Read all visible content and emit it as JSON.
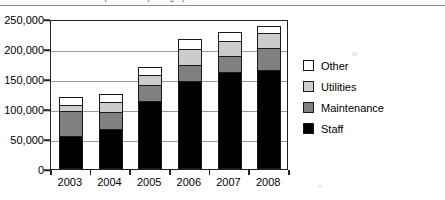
{
  "figure": {
    "cropped_caption": "expenditure by category",
    "background_color": "#ffffff",
    "frame_color": "#222222",
    "gridline_color": "#9a9a9a"
  },
  "chart_data": {
    "type": "bar",
    "subtype": "stacked",
    "title": "",
    "xlabel": "",
    "ylabel": "",
    "categories": [
      "2003",
      "2004",
      "2005",
      "2006",
      "2007",
      "2008"
    ],
    "series": [
      {
        "name": "Staff",
        "color": "#000000",
        "values": [
          55000,
          67000,
          113000,
          147000,
          162000,
          165000
        ]
      },
      {
        "name": "Maintenance",
        "color": "#808080",
        "values": [
          42000,
          28000,
          27000,
          26000,
          26000,
          37000
        ]
      },
      {
        "name": "Utilities",
        "color": "#cccccc",
        "values": [
          10000,
          17000,
          17000,
          27000,
          25000,
          25000
        ]
      },
      {
        "name": "Other",
        "color": "#ffffff",
        "values": [
          13000,
          13000,
          13000,
          17000,
          15000,
          11000
        ]
      }
    ],
    "totals": [
      120000,
      125000,
      170000,
      217000,
      228000,
      238000
    ],
    "ylim": [
      0,
      250000
    ],
    "ytick_values": [
      0,
      50000,
      100000,
      150000,
      200000,
      250000
    ],
    "ytick_labels": [
      "0",
      "50,000",
      "100,000",
      "150,000",
      "200,000",
      "250,000"
    ],
    "grid": true,
    "legend_position": "right",
    "legend_entries": [
      {
        "label": "Other",
        "color": "#ffffff"
      },
      {
        "label": "Utilities",
        "color": "#cccccc"
      },
      {
        "label": "Maintenance",
        "color": "#808080"
      },
      {
        "label": "Staff",
        "color": "#000000"
      }
    ]
  }
}
